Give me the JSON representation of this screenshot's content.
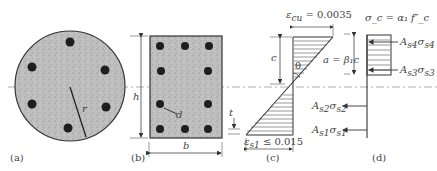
{
  "figure": {
    "panels": [
      {
        "id": "a",
        "label": "(a)",
        "description": "Circular column section with 6 bars",
        "dims": {
          "radius_label": "r"
        }
      },
      {
        "id": "b",
        "label": "(b)",
        "description": "Rectangular column section with 10 bars",
        "dims": {
          "height_label": "h",
          "width_label": "b",
          "cover_label": "t",
          "bar_label": "d"
        }
      },
      {
        "id": "c",
        "label": "(c)",
        "description": "Strain distribution",
        "top_strain": "ε_cu = 0.0035",
        "top_strain_sym": "ε",
        "top_strain_sub": "cu",
        "top_strain_val": " = 0.0035",
        "bottom_strain_sym": "ε",
        "bottom_strain_sub": "s1",
        "bottom_strain_val": " ≤ 0.015",
        "depth_label": "c",
        "angle_label": "θ",
        "block_label": "a = β₁c"
      },
      {
        "id": "d",
        "label": "(d)",
        "description": "Stress block and bar forces",
        "stress_label": "σ_c = α₁ f″_c",
        "block_depth_label": "β₁c",
        "forces": [
          {
            "name": "A_s4 σ_s4",
            "A": "A",
            "sub": "s4",
            "sigma": "σ",
            "sub2": "s4",
            "direction": "right"
          },
          {
            "name": "A_s3 σ_s3",
            "A": "A",
            "sub": "s3",
            "sigma": "σ",
            "sub2": "s3",
            "direction": "right"
          },
          {
            "name": "A_s2 σ_s2",
            "A": "A",
            "sub": "s2",
            "sigma": "σ",
            "sub2": "s2",
            "direction": "left"
          },
          {
            "name": "A_s1 σ_s1",
            "A": "A",
            "sub": "s1",
            "sigma": "σ",
            "sub2": "s1",
            "direction": "left"
          }
        ]
      }
    ],
    "colors": {
      "concrete": "#b8b8b8",
      "bar": "#1e1e1e",
      "line": "#333333",
      "axis": "#888888"
    }
  }
}
